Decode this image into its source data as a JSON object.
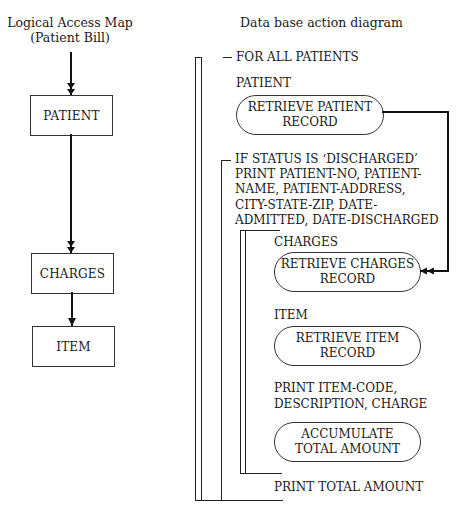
{
  "left_diagram": {
    "title_line1": "Logical Access Map",
    "title_line2": "(Patient Bill)",
    "entities": [
      {
        "label": "PATIENT"
      },
      {
        "label": "CHARGES"
      },
      {
        "label": "ITEM"
      }
    ]
  },
  "right_diagram": {
    "title": "Data base action diagram",
    "outer_loop": "FOR ALL PATIENTS",
    "patient_entity": "PATIENT",
    "retrieve_patient": {
      "line1": "RETRIEVE PATIENT",
      "line2": "RECORD"
    },
    "condition": {
      "lines": [
        "IF STATUS IS ‘DISCHARGED’",
        "PRINT PATIENT-NO, PATIENT-",
        "NAME, PATIENT-ADDRESS,",
        "CITY-STATE-ZIP, DATE-",
        "ADMITTED, DATE-DISCHARGED"
      ]
    },
    "charges_entity": "CHARGES",
    "retrieve_charges": {
      "line1": "RETRIEVE CHARGES",
      "line2": "RECORD"
    },
    "item_entity": "ITEM",
    "retrieve_item": {
      "line1": "RETRIEVE ITEM",
      "line2": "RECORD"
    },
    "print_item": {
      "line1": "PRINT ITEM-CODE,",
      "line2": "DESCRIPTION, CHARGE"
    },
    "accumulate": {
      "line1": "ACCUMULATE",
      "line2": "TOTAL AMOUNT"
    },
    "print_total": "PRINT TOTAL AMOUNT"
  }
}
